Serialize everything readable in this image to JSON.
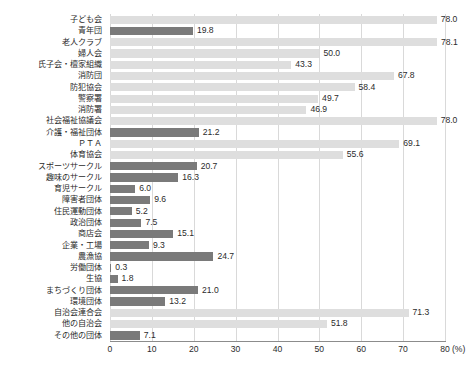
{
  "chart_data": {
    "type": "bar",
    "orientation": "horizontal",
    "title": "",
    "subtitle": "",
    "xlabel": "(%)",
    "ylabel": "",
    "xlim": [
      0,
      80
    ],
    "xticks": [
      0,
      10,
      20,
      30,
      40,
      50,
      60,
      70,
      80
    ],
    "xtick_labels": [
      "0",
      "10",
      "20",
      "30",
      "40",
      "50",
      "60",
      "70",
      "80"
    ],
    "unit": "(%)",
    "grid": true,
    "grid_axis": "x",
    "legend": "none",
    "colors": {
      "light_bar": "#dedede",
      "dark_bar": "#7a7a7a",
      "gridline": "#d9d9d9",
      "axis": "#8c8c8c",
      "text": "#2b2b2b"
    },
    "categories": [
      "子ども会",
      "青年団",
      "老人クラブ",
      "婦人会",
      "氏子会・檀家組織",
      "消防団",
      "防犯協会",
      "警察署",
      "消防署",
      "社会福祉協議会",
      "介護・福祉団体",
      "ＰＴＡ",
      "体育協会",
      "スポーツサークル",
      "趣味のサークル",
      "育児サークル",
      "障害者団体",
      "住民運動団体",
      "政治団体",
      "商店会",
      "企業・工場",
      "農漁協",
      "労働団体",
      "生協",
      "まちづくり団体",
      "環境団体",
      "自治会連合会",
      "他の自治会",
      "その他の団体"
    ],
    "values": [
      78.0,
      19.8,
      78.1,
      50.0,
      43.3,
      67.8,
      58.4,
      49.7,
      46.9,
      78.0,
      21.2,
      69.1,
      55.6,
      20.7,
      16.3,
      6.0,
      9.6,
      5.2,
      7.5,
      15.1,
      9.3,
      24.7,
      0.3,
      1.8,
      21.0,
      13.2,
      71.3,
      51.8,
      7.1
    ],
    "value_labels": [
      "78.0",
      "19.8",
      "78.1",
      "50.0",
      "43.3",
      "67.8",
      "58.4",
      "49.7",
      "46.9",
      "78.0",
      "21.2",
      "69.1",
      "55.6",
      "20.7",
      "16.3",
      "6.0",
      "9.6",
      "5.2",
      "7.5",
      "15.1",
      "9.3",
      "24.7",
      "0.3",
      "1.8",
      "21.0",
      "13.2",
      "71.3",
      "51.8",
      "7.1"
    ],
    "bar_styles": [
      "light",
      "dark",
      "light",
      "light",
      "light",
      "light",
      "light",
      "light",
      "light",
      "light",
      "dark",
      "light",
      "light",
      "dark",
      "dark",
      "dark",
      "dark",
      "dark",
      "dark",
      "dark",
      "dark",
      "dark",
      "dark",
      "dark",
      "dark",
      "dark",
      "light",
      "light",
      "dark"
    ]
  }
}
